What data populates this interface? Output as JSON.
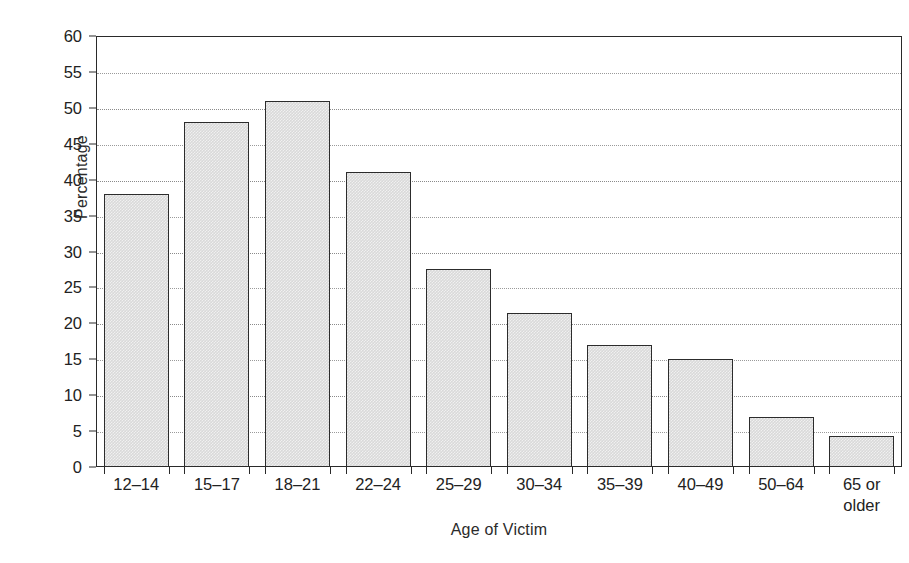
{
  "chart_data": {
    "type": "bar",
    "title": "",
    "xlabel": "Age of Victim",
    "ylabel": "Percentage",
    "categories": [
      "12–14",
      "15–17",
      "18–21",
      "22–24",
      "25–29",
      "30–34",
      "35–39",
      "40–49",
      "50–64",
      "65 or\nolder"
    ],
    "values": [
      38,
      48,
      51,
      41,
      27.5,
      21.5,
      17,
      15,
      7,
      4.3
    ],
    "ylim": [
      0,
      60
    ],
    "yticks": [
      0,
      5,
      10,
      15,
      20,
      25,
      30,
      35,
      40,
      45,
      50,
      55,
      60
    ],
    "ytick_labels": [
      "0",
      "5",
      "10",
      "15",
      "20",
      "25",
      "30",
      "35",
      "40",
      "45",
      "50",
      "55",
      "60"
    ],
    "grid": true,
    "grid_style": "dotted-horizontal",
    "legend": "none",
    "bar_fill_color": "#d9d9d9",
    "bar_edge_color": "#2c2c2c",
    "axis_color": "#2a2a2a",
    "background_color": "#ffffff"
  }
}
